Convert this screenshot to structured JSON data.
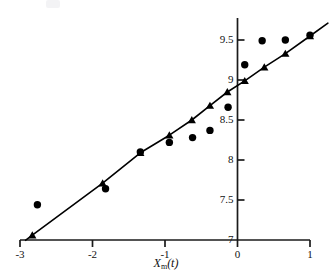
{
  "chart_data": {
    "type": "scatter",
    "title": "",
    "subtitle": "",
    "xlabel": "Xₘ(t)",
    "xlabel_base": "X",
    "xlabel_sub": "m",
    "xlabel_suffix": "(t)",
    "ylabel": "",
    "xlim": [
      -3.0,
      1.0
    ],
    "ylim": [
      7.0,
      9.62
    ],
    "xticks": [
      -3,
      -2,
      -1,
      0,
      1
    ],
    "xticklabels": [
      "-3",
      "-2",
      "-1",
      "0",
      "1"
    ],
    "yticks": [
      7,
      7.5,
      8,
      8.5,
      9,
      9.5
    ],
    "yticklabels": [
      "7",
      "7.5",
      "8",
      "8.5",
      "9",
      "9.5"
    ],
    "grid": false,
    "legend": "none",
    "axis_style": "left-spine-at-x0-and-bottom-spine",
    "series": [
      {
        "name": "observed",
        "marker": "circle",
        "color": "#000000",
        "line": "none",
        "points": [
          {
            "x": -2.76,
            "y": 7.44
          },
          {
            "x": -1.82,
            "y": 7.64
          },
          {
            "x": -1.34,
            "y": 8.1
          },
          {
            "x": -0.94,
            "y": 8.22
          },
          {
            "x": -0.62,
            "y": 8.28
          },
          {
            "x": -0.38,
            "y": 8.37
          },
          {
            "x": -0.13,
            "y": 8.66
          },
          {
            "x": 0.1,
            "y": 9.19
          },
          {
            "x": 0.34,
            "y": 9.49
          },
          {
            "x": 0.66,
            "y": 9.5
          },
          {
            "x": 1.0,
            "y": 9.56
          }
        ]
      },
      {
        "name": "fitted",
        "marker": "triangle",
        "color": "#000000",
        "line": "solid",
        "points": [
          {
            "x": -2.83,
            "y": 7.06
          },
          {
            "x": -1.86,
            "y": 7.71
          },
          {
            "x": -1.34,
            "y": 8.09
          },
          {
            "x": -0.94,
            "y": 8.31
          },
          {
            "x": -0.63,
            "y": 8.5
          },
          {
            "x": -0.38,
            "y": 8.68
          },
          {
            "x": -0.14,
            "y": 8.85
          },
          {
            "x": 0.1,
            "y": 8.99
          },
          {
            "x": 0.37,
            "y": 9.16
          },
          {
            "x": 0.66,
            "y": 9.33
          },
          {
            "x": 1.0,
            "y": 9.55
          }
        ],
        "line_extends_beyond_last_point": true
      }
    ]
  }
}
